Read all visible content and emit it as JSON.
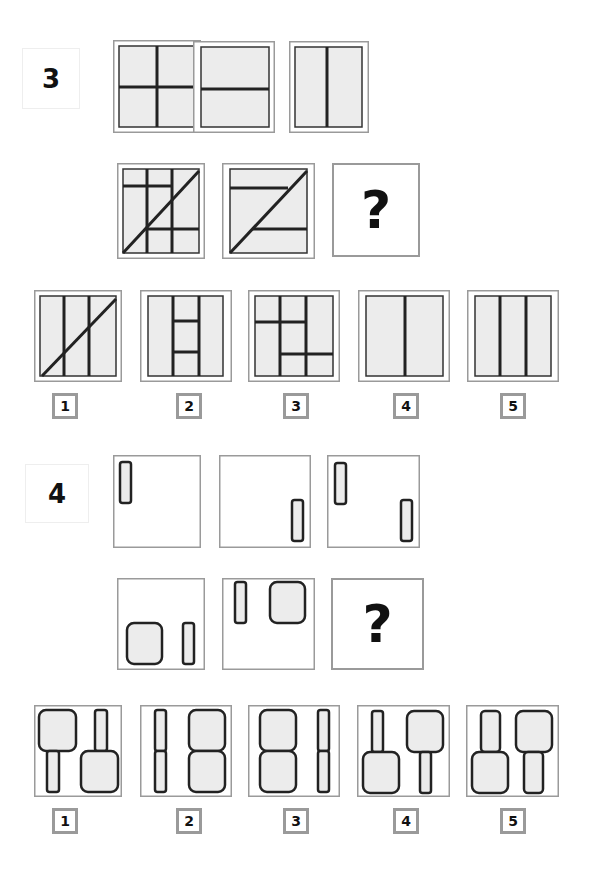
{
  "puzzles": [
    {
      "number": "3",
      "question_mark": "?",
      "matrix_description": [
        "cross: vertical and horizontal center lines",
        "horizontal center line",
        "vertical center line",
        "two vertical lines, two partial horizontals, diagonal",
        "two partial horizontals, diagonal (Z shape)",
        "missing"
      ],
      "options": [
        {
          "label": "1",
          "description": "two vertical lines with diagonal"
        },
        {
          "label": "2",
          "description": "two vertical lines with two short rungs between"
        },
        {
          "label": "3",
          "description": "two vertical lines with partial horizontals"
        },
        {
          "label": "4",
          "description": "single vertical line"
        },
        {
          "label": "5",
          "description": "two vertical lines"
        }
      ]
    },
    {
      "number": "4",
      "question_mark": "?",
      "matrix_description": [
        "thin bar top-left",
        "thin bar bottom-right",
        "thin bar top-left and thin bar bottom-right",
        "rounded square bottom-left, thin bar bottom-right",
        "thin bar top-left, rounded square top-right",
        "missing"
      ],
      "options": [
        {
          "label": "1",
          "description": "square over bar left; bar over square right"
        },
        {
          "label": "2",
          "description": "two bars stacked left; two squares stacked right"
        },
        {
          "label": "3",
          "description": "two squares stacked left; two bars stacked right"
        },
        {
          "label": "4",
          "description": "bar over square left; square over bar right"
        },
        {
          "label": "5",
          "description": "wide bar over square left; square over wide bar right"
        }
      ]
    }
  ],
  "colors": {
    "frame": "#9a9a9a",
    "inner_fill": "#ececec",
    "line": "#222222"
  }
}
